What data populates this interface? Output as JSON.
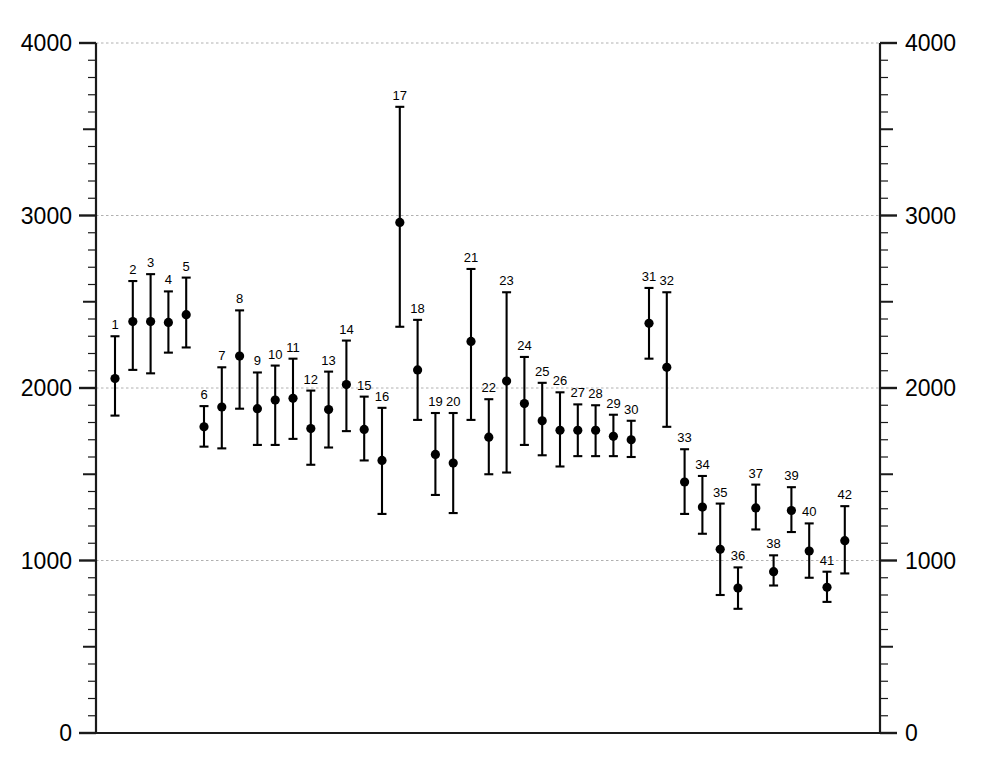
{
  "chart_data": {
    "type": "scatter",
    "title": "",
    "subtitle": "",
    "xlabel": "",
    "ylabel": "",
    "ylim": [
      0,
      4000
    ],
    "xlim": [
      0,
      43
    ],
    "grid": true,
    "gridlines_y": [
      1000,
      2000,
      3000,
      4000
    ],
    "legend_position": "none",
    "axes": {
      "left": {
        "tick_labels": [
          "0",
          "1000",
          "2000",
          "3000",
          "4000"
        ],
        "tick_values": [
          0,
          1000,
          2000,
          3000,
          4000
        ],
        "major_interval": 1000,
        "medium_interval": 500,
        "minor_interval": 100
      },
      "right": {
        "tick_labels": [
          "0",
          "1000",
          "2000",
          "3000",
          "4000"
        ],
        "tick_values": [
          0,
          1000,
          2000,
          3000,
          4000
        ],
        "major_interval": 1000,
        "medium_interval": 500,
        "minor_interval": 100
      },
      "bottom": {
        "tick_labels": [],
        "visible": true
      }
    },
    "marker": {
      "shape": "circle",
      "color": "#000000",
      "size": 8,
      "errorbar_color": "#000000",
      "errorbar_capwidth": 9
    },
    "series": [
      {
        "name": "measurements",
        "point_label_position": "above-upper-cap",
        "points": [
          {
            "label": "1",
            "x": 1,
            "value": 2055,
            "low": 1840,
            "high": 2300
          },
          {
            "label": "2",
            "x": 2,
            "value": 2385,
            "low": 2105,
            "high": 2620
          },
          {
            "label": "3",
            "x": 3,
            "value": 2385,
            "low": 2085,
            "high": 2660
          },
          {
            "label": "4",
            "x": 4,
            "value": 2380,
            "low": 2205,
            "high": 2560
          },
          {
            "label": "5",
            "x": 5,
            "value": 2425,
            "low": 2235,
            "high": 2640
          },
          {
            "label": "6",
            "x": 6,
            "value": 1775,
            "low": 1660,
            "high": 1895
          },
          {
            "label": "7",
            "x": 7,
            "value": 1890,
            "low": 1650,
            "high": 2120
          },
          {
            "label": "8",
            "x": 8,
            "value": 2185,
            "low": 1880,
            "high": 2450
          },
          {
            "label": "9",
            "x": 9,
            "value": 1880,
            "low": 1670,
            "high": 2090
          },
          {
            "label": "10",
            "x": 10,
            "value": 1930,
            "low": 1670,
            "high": 2130
          },
          {
            "label": "11",
            "x": 11,
            "value": 1940,
            "low": 1705,
            "high": 2170
          },
          {
            "label": "12",
            "x": 12,
            "value": 1765,
            "low": 1555,
            "high": 1985
          },
          {
            "label": "13",
            "x": 13,
            "value": 1875,
            "low": 1655,
            "high": 2095
          },
          {
            "label": "14",
            "x": 14,
            "value": 2020,
            "low": 1750,
            "high": 2275
          },
          {
            "label": "15",
            "x": 15,
            "value": 1760,
            "low": 1580,
            "high": 1950
          },
          {
            "label": "16",
            "x": 16,
            "value": 1580,
            "low": 1270,
            "high": 1885
          },
          {
            "label": "17",
            "x": 17,
            "value": 2960,
            "low": 2355,
            "high": 3630
          },
          {
            "label": "18",
            "x": 18,
            "value": 2105,
            "low": 1815,
            "high": 2395
          },
          {
            "label": "19",
            "x": 19,
            "value": 1615,
            "low": 1380,
            "high": 1855
          },
          {
            "label": "20",
            "x": 20,
            "value": 1565,
            "low": 1275,
            "high": 1855
          },
          {
            "label": "21",
            "x": 21,
            "value": 2270,
            "low": 1815,
            "high": 2690
          },
          {
            "label": "22",
            "x": 22,
            "value": 1715,
            "low": 1500,
            "high": 1935
          },
          {
            "label": "23",
            "x": 23,
            "value": 2040,
            "low": 1510,
            "high": 2555
          },
          {
            "label": "24",
            "x": 24,
            "value": 1910,
            "low": 1670,
            "high": 2180
          },
          {
            "label": "25",
            "x": 25,
            "value": 1810,
            "low": 1610,
            "high": 2030
          },
          {
            "label": "26",
            "x": 26,
            "value": 1755,
            "low": 1545,
            "high": 1975
          },
          {
            "label": "27",
            "x": 27,
            "value": 1755,
            "low": 1605,
            "high": 1905
          },
          {
            "label": "28",
            "x": 28,
            "value": 1755,
            "low": 1605,
            "high": 1900
          },
          {
            "label": "29",
            "x": 29,
            "value": 1720,
            "low": 1605,
            "high": 1845
          },
          {
            "label": "30",
            "x": 30,
            "value": 1700,
            "low": 1600,
            "high": 1810
          },
          {
            "label": "31",
            "x": 31,
            "value": 2375,
            "low": 2170,
            "high": 2580
          },
          {
            "label": "32",
            "x": 32,
            "value": 2120,
            "low": 1775,
            "high": 2555
          },
          {
            "label": "33",
            "x": 33,
            "value": 1455,
            "low": 1270,
            "high": 1645
          },
          {
            "label": "34",
            "x": 34,
            "value": 1310,
            "low": 1155,
            "high": 1490
          },
          {
            "label": "35",
            "x": 35,
            "value": 1065,
            "low": 800,
            "high": 1330
          },
          {
            "label": "36",
            "x": 36,
            "value": 840,
            "low": 720,
            "high": 960
          },
          {
            "label": "37",
            "x": 37,
            "value": 1305,
            "low": 1180,
            "high": 1440
          },
          {
            "label": "38",
            "x": 38,
            "value": 935,
            "low": 855,
            "high": 1030
          },
          {
            "label": "39",
            "x": 39,
            "value": 1290,
            "low": 1165,
            "high": 1425
          },
          {
            "label": "40",
            "x": 40,
            "value": 1055,
            "low": 900,
            "high": 1215
          },
          {
            "label": "41",
            "x": 41,
            "value": 845,
            "low": 760,
            "high": 935
          },
          {
            "label": "42",
            "x": 42,
            "value": 1115,
            "low": 925,
            "high": 1315
          }
        ]
      }
    ]
  },
  "colors": {
    "background": "#ffffff",
    "axis": "#1a1a1a",
    "grid": "#b0b0b0",
    "marker": "#000000"
  }
}
